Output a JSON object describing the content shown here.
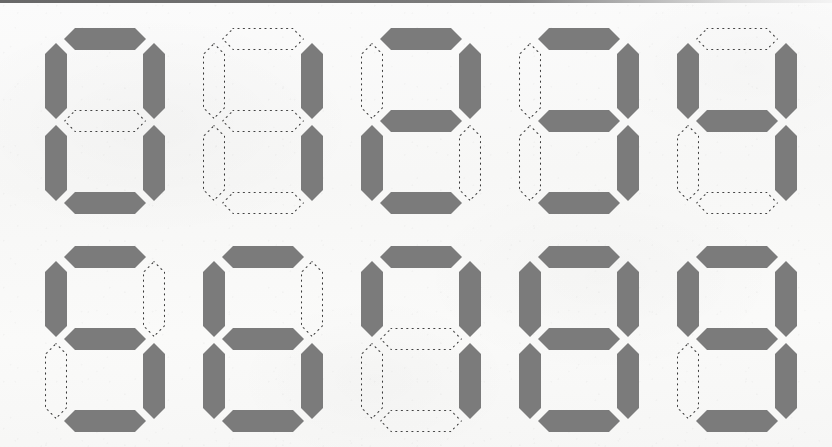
{
  "page": {
    "background_color": "#f8f8f7",
    "segment_on_color": "#7b7b7b",
    "segment_off_outline_color": "#3a3a3a",
    "top_edge_bar_color": "#5a5a5a",
    "grid_columns": 5,
    "grid_rows": 2,
    "digit_count": 10
  },
  "segment_labels": [
    "a",
    "b",
    "c",
    "d",
    "e",
    "f",
    "g"
  ],
  "segment_label_meaning": {
    "a": "top",
    "b": "upper-right",
    "c": "lower-right",
    "d": "bottom",
    "e": "lower-left",
    "f": "upper-left",
    "g": "middle"
  },
  "digits": [
    {
      "value": "0",
      "row": 0,
      "col": 0,
      "x": 45,
      "y": 28,
      "on_segments": [
        "a",
        "b",
        "c",
        "d",
        "e",
        "f"
      ],
      "off_segments": [
        "g"
      ],
      "segments": {
        "a": true,
        "b": true,
        "c": true,
        "d": true,
        "e": true,
        "f": true,
        "g": false
      }
    },
    {
      "value": "1",
      "row": 0,
      "col": 1,
      "x": 203,
      "y": 28,
      "on_segments": [
        "b",
        "c"
      ],
      "off_segments": [
        "a",
        "d",
        "e",
        "f",
        "g"
      ],
      "segments": {
        "a": false,
        "b": true,
        "c": true,
        "d": false,
        "e": false,
        "f": false,
        "g": false
      }
    },
    {
      "value": "2",
      "row": 0,
      "col": 2,
      "x": 361,
      "y": 28,
      "on_segments": [
        "a",
        "b",
        "g",
        "e",
        "d"
      ],
      "off_segments": [
        "c",
        "f"
      ],
      "segments": {
        "a": true,
        "b": true,
        "c": false,
        "d": true,
        "e": true,
        "f": false,
        "g": true
      }
    },
    {
      "value": "3",
      "row": 0,
      "col": 3,
      "x": 519,
      "y": 28,
      "on_segments": [
        "a",
        "b",
        "g",
        "c",
        "d"
      ],
      "off_segments": [
        "e",
        "f"
      ],
      "segments": {
        "a": true,
        "b": true,
        "c": true,
        "d": true,
        "e": false,
        "f": false,
        "g": true
      }
    },
    {
      "value": "4",
      "row": 0,
      "col": 4,
      "x": 677,
      "y": 28,
      "on_segments": [
        "f",
        "b",
        "g",
        "c"
      ],
      "off_segments": [
        "a",
        "d",
        "e"
      ],
      "segments": {
        "a": false,
        "b": true,
        "c": true,
        "d": false,
        "e": false,
        "f": true,
        "g": true
      }
    },
    {
      "value": "5",
      "row": 1,
      "col": 0,
      "x": 45,
      "y": 246,
      "on_segments": [
        "a",
        "f",
        "g",
        "c",
        "d"
      ],
      "off_segments": [
        "b",
        "e"
      ],
      "segments": {
        "a": true,
        "b": false,
        "c": true,
        "d": true,
        "e": false,
        "f": true,
        "g": true
      }
    },
    {
      "value": "6",
      "row": 1,
      "col": 1,
      "x": 203,
      "y": 246,
      "on_segments": [
        "a",
        "f",
        "g",
        "e",
        "c",
        "d"
      ],
      "off_segments": [
        "b"
      ],
      "segments": {
        "a": true,
        "b": false,
        "c": true,
        "d": true,
        "e": true,
        "f": true,
        "g": true
      }
    },
    {
      "value": "7",
      "row": 1,
      "col": 2,
      "x": 361,
      "y": 246,
      "on_segments": [
        "a",
        "b",
        "c",
        "f"
      ],
      "off_segments": [
        "d",
        "e",
        "g"
      ],
      "segments": {
        "a": true,
        "b": true,
        "c": true,
        "d": false,
        "e": false,
        "f": true,
        "g": false
      }
    },
    {
      "value": "8",
      "row": 1,
      "col": 3,
      "x": 519,
      "y": 246,
      "on_segments": [
        "a",
        "b",
        "c",
        "d",
        "e",
        "f",
        "g"
      ],
      "off_segments": [],
      "segments": {
        "a": true,
        "b": true,
        "c": true,
        "d": true,
        "e": true,
        "f": true,
        "g": true
      }
    },
    {
      "value": "9",
      "row": 1,
      "col": 4,
      "x": 677,
      "y": 246,
      "on_segments": [
        "a",
        "b",
        "c",
        "d",
        "f",
        "g"
      ],
      "off_segments": [
        "e"
      ],
      "segments": {
        "a": true,
        "b": true,
        "c": true,
        "d": true,
        "e": false,
        "f": true,
        "g": true
      }
    }
  ]
}
